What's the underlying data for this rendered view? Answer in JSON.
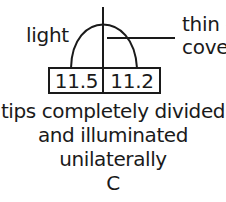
{
  "diagram": {
    "labels": {
      "left": "light",
      "right_line1": "thin g",
      "right_line2": "cover"
    },
    "box": {
      "left_value": "11.5",
      "right_value": "11.2"
    },
    "caption": {
      "line1": "tips completely divided",
      "line2": "and illuminated",
      "line3": "unilaterally",
      "panel": "C"
    },
    "colors": {
      "stroke": "#1a1a1a",
      "background": "#ffffff"
    }
  }
}
